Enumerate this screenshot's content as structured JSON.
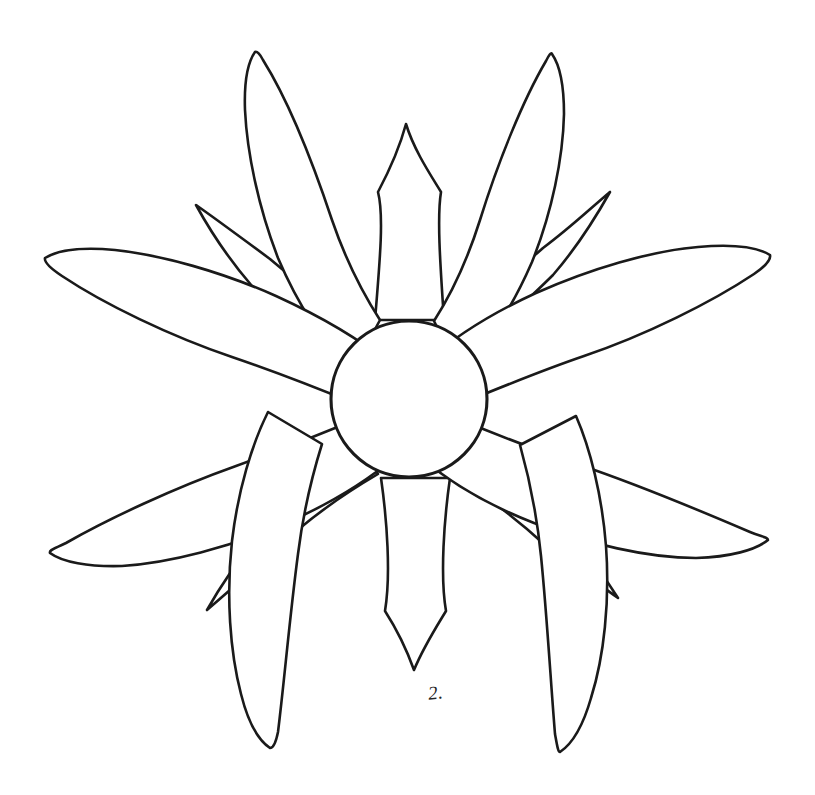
{
  "page": {
    "background_color": "#ffffff",
    "line_color": "#1a1a1a",
    "fill_color": "#ffffff",
    "width": 815,
    "height": 795
  },
  "artwork": {
    "subject": "daisy-flower-outline",
    "style": "hand-drawn black line art, uncolored coloring-book template",
    "center": {
      "label": "flower-center-disc",
      "cx": 409,
      "cy": 399,
      "r": 78
    },
    "petal_count_large": 8,
    "petal_count_narrow": 6,
    "petals": [
      {
        "id": "petal-top-left-large",
        "tip_x": 255,
        "tip_y": 52
      },
      {
        "id": "petal-top-right-large",
        "tip_x": 552,
        "tip_y": 54
      },
      {
        "id": "petal-left-upper-large",
        "tip_x": 45,
        "tip_y": 258
      },
      {
        "id": "petal-right-upper-large",
        "tip_x": 770,
        "tip_y": 255
      },
      {
        "id": "petal-left-lower-large",
        "tip_x": 50,
        "tip_y": 553
      },
      {
        "id": "petal-right-lower-large",
        "tip_x": 768,
        "tip_y": 540
      },
      {
        "id": "petal-bottom-left-large",
        "tip_x": 270,
        "tip_y": 748
      },
      {
        "id": "petal-bottom-right-large",
        "tip_x": 560,
        "tip_y": 752
      },
      {
        "id": "petal-top-center-narrow",
        "tip_x": 406,
        "tip_y": 124
      },
      {
        "id": "petal-bottom-center-narrow",
        "tip_x": 414,
        "tip_y": 670
      },
      {
        "id": "petal-upper-left-narrow",
        "tip_x": 196,
        "tip_y": 205
      },
      {
        "id": "petal-upper-right-narrow",
        "tip_x": 610,
        "tip_y": 192
      },
      {
        "id": "petal-lower-left-narrow",
        "tip_x": 207,
        "tip_y": 610
      },
      {
        "id": "petal-lower-right-narrow",
        "tip_x": 618,
        "tip_y": 598
      }
    ]
  },
  "annotation": {
    "handwritten_mark": "2.",
    "x": 428,
    "y": 682
  }
}
